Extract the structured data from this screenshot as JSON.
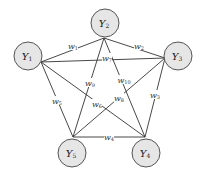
{
  "diagram": {
    "type": "complete-graph-pentagon",
    "nodes": [
      {
        "id": "Y1",
        "base": "Y",
        "sub": "1",
        "cx": 28,
        "cy": 56,
        "r": 14,
        "ax": 41,
        "ay": 62
      },
      {
        "id": "Y2",
        "base": "Y",
        "sub": "2",
        "cx": 105,
        "cy": 23,
        "r": 14,
        "ax": 104,
        "ay": 38
      },
      {
        "id": "Y3",
        "base": "Y",
        "sub": "3",
        "cx": 178,
        "cy": 56,
        "r": 14,
        "ax": 165,
        "ay": 58
      },
      {
        "id": "Y4",
        "base": "Y",
        "sub": "4",
        "cx": 146,
        "cy": 153,
        "r": 14,
        "ax": 145,
        "ay": 137
      },
      {
        "id": "Y5",
        "base": "Y",
        "sub": "5",
        "cx": 72,
        "cy": 153,
        "r": 14,
        "ax": 73,
        "ay": 137
      }
    ],
    "edges": [
      {
        "from": "Y1",
        "to": "Y2",
        "base": "w",
        "sub": "1",
        "lx": 73,
        "ly": 46
      },
      {
        "from": "Y2",
        "to": "Y3",
        "base": "w",
        "sub": "2",
        "lx": 139,
        "ly": 46
      },
      {
        "from": "Y3",
        "to": "Y4",
        "base": "w",
        "sub": "3",
        "lx": 155,
        "ly": 95
      },
      {
        "from": "Y4",
        "to": "Y5",
        "base": "w",
        "sub": "4",
        "lx": 109,
        "ly": 137
      },
      {
        "from": "Y1",
        "to": "Y5",
        "base": "w",
        "sub": "5",
        "lx": 57,
        "ly": 101
      },
      {
        "from": "Y1",
        "to": "Y4",
        "base": "w",
        "sub": "6",
        "lx": 97,
        "ly": 104
      },
      {
        "from": "Y1",
        "to": "Y3",
        "base": "w",
        "sub": "7",
        "lx": 107,
        "ly": 58
      },
      {
        "from": "Y5",
        "to": "Y3",
        "base": "w",
        "sub": "8",
        "lx": 119,
        "ly": 98
      },
      {
        "from": "Y2",
        "to": "Y5",
        "base": "w",
        "sub": "9",
        "lx": 90,
        "ly": 83
      },
      {
        "from": "Y2",
        "to": "Y4",
        "base": "w",
        "sub": "10",
        "lx": 124,
        "ly": 80
      }
    ]
  }
}
